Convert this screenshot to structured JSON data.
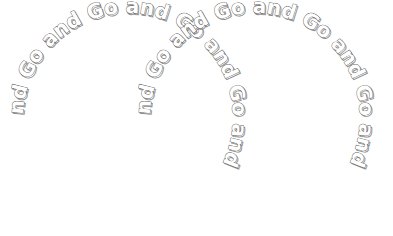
{
  "artwork": {
    "title": "Go and",
    "description": "Two overlapping circles of repeating outlined text",
    "phrase": "Go and",
    "words": [
      "Go",
      "and"
    ],
    "repeat_text": "Go and Go and Go and Go and Go and Go and ",
    "style": {
      "fill_color": "#ffffff",
      "stroke_color": "#5a5a5a",
      "shadow_color": "#8d8d8d",
      "background_color": "#ffffff",
      "font_size_px": 20,
      "outlined": "true"
    },
    "canvas": {
      "width": 393,
      "height": 236
    },
    "shapes": [
      {
        "name": "left-circle",
        "cx": 128,
        "cy": 118,
        "r": 105,
        "text": "Go and Go and Go and Go and Go and ",
        "start_offset_pct": 25
      },
      {
        "name": "right-circle",
        "cx": 255,
        "cy": 118,
        "r": 105,
        "text": "Go and Go and Go and Go and Go and ",
        "start_offset_pct": 25
      }
    ]
  }
}
